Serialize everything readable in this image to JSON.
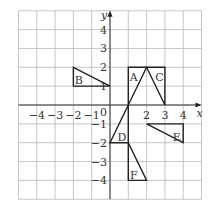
{
  "diagram": {
    "type": "coordinate-grid",
    "x_range": [
      -5,
      5
    ],
    "y_range": [
      -5,
      5
    ],
    "axis_labels": {
      "x": "x",
      "y": "y"
    },
    "origin_label": "0",
    "x_tick_labels": [
      {
        "v": -4,
        "t": "−4"
      },
      {
        "v": -3,
        "t": "−3"
      },
      {
        "v": -2,
        "t": "−2"
      },
      {
        "v": -1,
        "t": "−1"
      },
      {
        "v": 2,
        "t": "2"
      },
      {
        "v": 3,
        "t": "3"
      },
      {
        "v": 4,
        "t": "4"
      }
    ],
    "y_tick_labels": [
      {
        "v": 4,
        "t": "4"
      },
      {
        "v": 3,
        "t": "3"
      },
      {
        "v": 2,
        "t": "2"
      },
      {
        "v": 1,
        "t": "1"
      },
      {
        "v": -1,
        "t": "−1"
      },
      {
        "v": -2,
        "t": "−2"
      },
      {
        "v": -3,
        "t": "−3"
      },
      {
        "v": -4,
        "t": "−4"
      }
    ],
    "shapes": [
      {
        "label": "A",
        "points": [
          [
            1,
            0
          ],
          [
            1,
            2
          ],
          [
            2,
            2
          ]
        ],
        "label_at": [
          1.3,
          1.5
        ]
      },
      {
        "label": "B",
        "points": [
          [
            -2,
            2
          ],
          [
            -2,
            1
          ],
          [
            0,
            1
          ]
        ],
        "label_at": [
          -1.7,
          1.3
        ]
      },
      {
        "label": "C",
        "points": [
          [
            2,
            2
          ],
          [
            3,
            2
          ],
          [
            3,
            0
          ]
        ],
        "label_at": [
          2.7,
          1.5
        ]
      },
      {
        "label": "D",
        "points": [
          [
            0,
            -2
          ],
          [
            1,
            -2
          ],
          [
            1,
            0
          ]
        ],
        "label_at": [
          0.65,
          -1.7
        ]
      },
      {
        "label": "E",
        "points": [
          [
            2,
            -1
          ],
          [
            4,
            -1
          ],
          [
            4,
            -2
          ]
        ],
        "label_at": [
          3.65,
          -1.7
        ]
      },
      {
        "label": "F",
        "points": [
          [
            1,
            -2
          ],
          [
            1,
            -4
          ],
          [
            2,
            -4
          ]
        ],
        "label_at": [
          1.3,
          -3.7
        ]
      }
    ]
  }
}
